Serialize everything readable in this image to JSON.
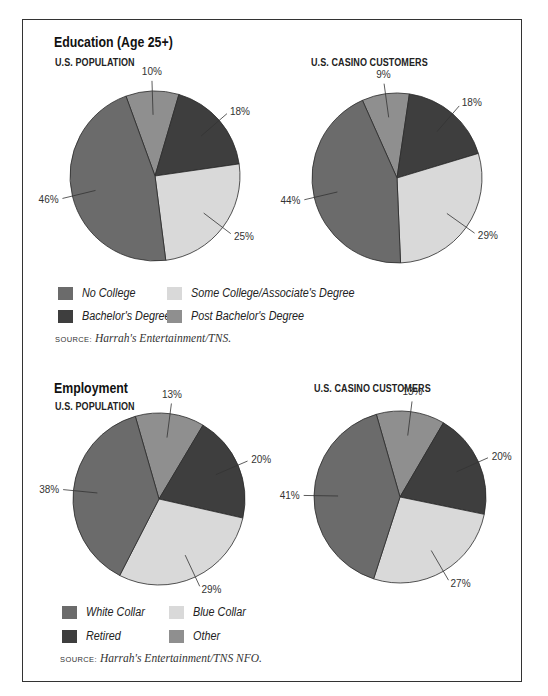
{
  "colors": {
    "no_college": "#6b6b6b",
    "some_college": "#d9d9d9",
    "bachelors": "#3e3e3e",
    "post_bachelors": "#8f8f8f",
    "white_collar": "#6b6b6b",
    "blue_collar": "#d9d9d9",
    "retired": "#3e3e3e",
    "other": "#8f8f8f"
  },
  "education": {
    "title": "Education (Age 25+)",
    "population_label": "U.S. POPULATION",
    "casino_label": "U.S. CASINO CUSTOMERS",
    "legend": [
      {
        "label": "No College"
      },
      {
        "label": "Some College/Associate's Degree"
      },
      {
        "label": "Bachelor's Degree"
      },
      {
        "label": "Post Bachelor's Degree"
      }
    ],
    "source_key": "SOURCE:",
    "source_value": "Harrah's Entertainment/TNS."
  },
  "employment": {
    "title": "Employment",
    "population_label": "U.S. POPULATION",
    "casino_label": "U.S. CASINO CUSTOMERS",
    "legend": [
      {
        "label": "White Collar"
      },
      {
        "label": "Blue Collar"
      },
      {
        "label": "Retired"
      },
      {
        "label": "Other"
      }
    ],
    "source_key": "SOURCE:",
    "source_value": "Harrah's Entertainment/TNS NFO."
  },
  "chart_data": [
    {
      "type": "pie",
      "title": "Education (Age 25+) — U.S. Population",
      "categories": [
        "Post Bachelor's Degree",
        "Bachelor's Degree",
        "Some College/Associate's Degree",
        "No College"
      ],
      "values": [
        10,
        18,
        25,
        46
      ],
      "labels": [
        "10%",
        "18%",
        "25%",
        "46%"
      ]
    },
    {
      "type": "pie",
      "title": "Education (Age 25+) — U.S. Casino Customers",
      "categories": [
        "Post Bachelor's Degree",
        "Bachelor's Degree",
        "Some College/Associate's Degree",
        "No College"
      ],
      "values": [
        9,
        18,
        29,
        44
      ],
      "labels": [
        "9%",
        "18%",
        "29%",
        "44%"
      ]
    },
    {
      "type": "pie",
      "title": "Employment — U.S. Population",
      "categories": [
        "Other",
        "Retired",
        "Blue Collar",
        "White Collar"
      ],
      "values": [
        13,
        20,
        29,
        38
      ],
      "labels": [
        "13%",
        "20%",
        "29%",
        "38%"
      ]
    },
    {
      "type": "pie",
      "title": "Employment — U.S. Casino Customers",
      "categories": [
        "Other",
        "Retired",
        "Blue Collar",
        "White Collar"
      ],
      "values": [
        13,
        20,
        27,
        41
      ],
      "labels": [
        "13%",
        "20%",
        "27%",
        "41%"
      ]
    }
  ]
}
